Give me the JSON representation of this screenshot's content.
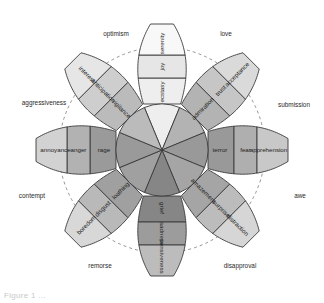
{
  "figure": {
    "type": "radial-diagram",
    "partial_caption": "Figure 1 ..."
  },
  "colors": {
    "outline": "#3a3a3a",
    "dashed_ring": "#7a7a7a",
    "background": "#ffffff",
    "intensity_joy": [
      "#eeeeee",
      "#e3e3e3",
      "#f7f7f7"
    ],
    "intensity_trust": [
      "#b6b6b6",
      "#c9c9c9",
      "#dcdcdc"
    ],
    "intensity_fear": [
      "#9a9a9a",
      "#b0b0b0",
      "#c6c6c6"
    ],
    "intensity_surprise": [
      "#a8a8a8",
      "#bdbdbd",
      "#d4d4d4"
    ],
    "intensity_sadness": [
      "#8a8a8a",
      "#9e9e9e",
      "#bdbdbd"
    ],
    "intensity_disgust": [
      "#a2a2a2",
      "#bababa",
      "#d6d6d6"
    ],
    "intensity_anger": [
      "#9c9c9c",
      "#b4b4b4",
      "#d0d0d0"
    ],
    "intensity_anticipation": [
      "#bcbcbc",
      "#cfcfcf",
      "#e4e4e4"
    ]
  },
  "chart_data": {
    "type": "pie",
    "legend": "",
    "petals": [
      {
        "basic": "joy",
        "angle_deg": 270,
        "inner": "ecstasy",
        "middle": "joy",
        "outer": "serenity",
        "shades": [
          "#eeeeee",
          "#e6e6e6",
          "#f8f8f8"
        ]
      },
      {
        "basic": "trust",
        "angle_deg": 315,
        "inner": "admiration",
        "middle": "trust",
        "outer": "acceptance",
        "shades": [
          "#b3b3b3",
          "#c6c6c6",
          "#dadada"
        ]
      },
      {
        "basic": "fear",
        "angle_deg": 0,
        "inner": "terror",
        "middle": "fear",
        "outer": "apprehension",
        "shades": [
          "#999999",
          "#afafaf",
          "#c8c8c8"
        ]
      },
      {
        "basic": "surprise",
        "angle_deg": 45,
        "inner": "amazement",
        "middle": "surprise",
        "outer": "distraction",
        "shades": [
          "#a5a5a5",
          "#bcbcbc",
          "#d6d6d6"
        ]
      },
      {
        "basic": "sadness",
        "angle_deg": 90,
        "inner": "grief",
        "middle": "sadness",
        "outer": "pensiveness",
        "shades": [
          "#868686",
          "#9c9c9c",
          "#bcbcbc"
        ]
      },
      {
        "basic": "disgust",
        "angle_deg": 135,
        "inner": "loathing",
        "middle": "disgust",
        "outer": "boredom",
        "shades": [
          "#a0a0a0",
          "#b9b9b9",
          "#d8d8d8"
        ]
      },
      {
        "basic": "anger",
        "angle_deg": 180,
        "inner": "rage",
        "middle": "anger",
        "outer": "annoyance",
        "shades": [
          "#9a9a9a",
          "#b2b2b2",
          "#d2d2d2"
        ]
      },
      {
        "basic": "anticipation",
        "angle_deg": 225,
        "inner": "vigilance",
        "middle": "anticipation",
        "outer": "interest",
        "shades": [
          "#bbbbbb",
          "#cecece",
          "#e6e6e6"
        ]
      }
    ],
    "dyads": [
      {
        "label": "love",
        "x": 226,
        "y": 34,
        "anchor": "middle"
      },
      {
        "label": "submission",
        "x": 294,
        "y": 105,
        "anchor": "middle"
      },
      {
        "label": "awe",
        "x": 300,
        "y": 196,
        "anchor": "middle"
      },
      {
        "label": "disapproval",
        "x": 240,
        "y": 266,
        "anchor": "middle"
      },
      {
        "label": "remorse",
        "x": 100,
        "y": 266,
        "anchor": "middle"
      },
      {
        "label": "contempt",
        "x": 32,
        "y": 196,
        "anchor": "middle"
      },
      {
        "label": "aggressiveness",
        "x": 44,
        "y": 103,
        "anchor": "middle"
      },
      {
        "label": "optimism",
        "x": 116,
        "y": 34,
        "anchor": "middle"
      }
    ],
    "ring_order_inner_to_outer": [
      "inner",
      "middle",
      "outer"
    ]
  }
}
